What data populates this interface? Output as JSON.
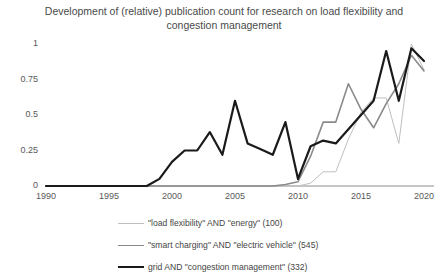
{
  "chart_data": {
    "type": "line",
    "title": "Development of (relative) publication count for research on load flexibility and congestion management",
    "xlabel": "",
    "ylabel": "",
    "xlim": [
      1990,
      2020
    ],
    "ylim": [
      0,
      1
    ],
    "grid": false,
    "legend_position": "bottom",
    "xticks": [
      "1990",
      "1995",
      "2000",
      "2005",
      "2010",
      "2015",
      "2020"
    ],
    "yticks": [
      "0",
      "0.25",
      "0.5",
      "0.75",
      "1"
    ],
    "x": [
      1990,
      1991,
      1992,
      1993,
      1994,
      1995,
      1996,
      1997,
      1998,
      1999,
      2000,
      2001,
      2002,
      2003,
      2004,
      2005,
      2006,
      2007,
      2008,
      2009,
      2010,
      2011,
      2012,
      2013,
      2014,
      2015,
      2016,
      2017,
      2018,
      2019,
      2020
    ],
    "series": [
      {
        "name": "\"load flexibility\" AND \"energy\" (100)",
        "count": 100,
        "color": "#bfbfbf",
        "width": 1,
        "values": [
          0,
          0,
          0,
          0,
          0,
          0,
          0,
          0,
          0,
          0,
          0,
          0,
          0,
          0,
          0,
          0,
          0,
          0,
          0,
          0,
          0,
          0.02,
          0.1,
          0.1,
          0.33,
          0.52,
          0.62,
          0.62,
          0.3,
          1.0,
          0.82
        ]
      },
      {
        "name": "\"smart charging\" AND \"electric vehicle\" (545)",
        "count": 545,
        "color": "#8a8a8a",
        "width": 1.6,
        "values": [
          0,
          0,
          0,
          0,
          0,
          0,
          0,
          0,
          0,
          0,
          0,
          0,
          0,
          0,
          0,
          0,
          0,
          0,
          0,
          0.01,
          0.03,
          0.21,
          0.45,
          0.45,
          0.72,
          0.54,
          0.41,
          0.58,
          0.72,
          0.92,
          0.81
        ]
      },
      {
        "name": "grid AND \"congestion management\" (332)",
        "count": 332,
        "color": "#1a1a1a",
        "width": 2.2,
        "values": [
          0,
          0,
          0,
          0,
          0,
          0,
          0,
          0,
          0,
          0.05,
          0.17,
          0.25,
          0.25,
          0.38,
          0.22,
          0.6,
          0.3,
          0.26,
          0.22,
          0.45,
          0.05,
          0.28,
          0.32,
          0.3,
          0.4,
          0.5,
          0.6,
          0.95,
          0.6,
          0.97,
          0.88
        ]
      }
    ]
  },
  "legend": {
    "entries": [
      {
        "label": "\"load flexibility\" AND \"energy\" (100)"
      },
      {
        "label": "\"smart charging\" AND \"electric vehicle\" (545)"
      },
      {
        "label": "grid AND \"congestion management\" (332)"
      }
    ]
  }
}
